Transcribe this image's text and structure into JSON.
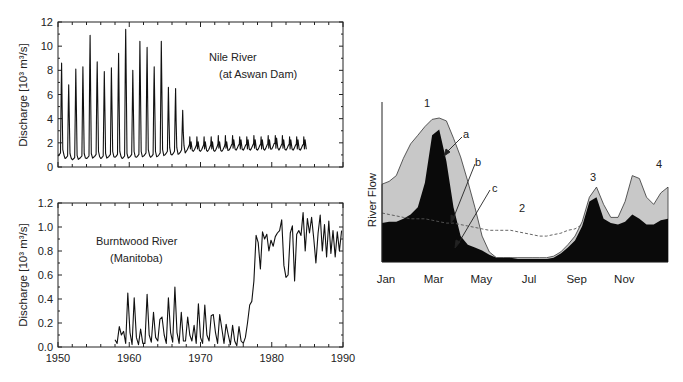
{
  "chart_data": [
    {
      "id": "nile",
      "type": "line",
      "title": "Nile River (at Aswan Dam)",
      "annotation_lines": [
        "Nile River",
        "(at Aswan Dam)"
      ],
      "xlabel": "",
      "ylabel": "Discharge [10³ m³/s]",
      "xlim": [
        1950,
        1990
      ],
      "ylim": [
        0,
        12
      ],
      "yticks": [
        0,
        2,
        4,
        6,
        8,
        10,
        12
      ],
      "xticks": [
        1950,
        1960,
        1970,
        1980,
        1990
      ],
      "show_xtick_labels": false,
      "grid": false,
      "series": [
        {
          "name": "Nile discharge",
          "annual_peaks": {
            "years": [
              1950.5,
              1951.5,
              1952.5,
              1953.5,
              1954.5,
              1955.5,
              1956.5,
              1957.5,
              1958.5,
              1959.5,
              1960.5,
              1961.5,
              1962.5,
              1963.5,
              1964.5,
              1965.5,
              1966.5,
              1967.5,
              1968.5,
              1969.5,
              1970.5,
              1971.5,
              1972.5,
              1973.5,
              1974.5,
              1975.5,
              1976.5,
              1977.5,
              1978.5,
              1979.5,
              1980.5,
              1981.5,
              1982.5,
              1983.5,
              1984.5
            ],
            "values": [
              8.6,
              6.8,
              8.1,
              8.3,
              10.9,
              8.7,
              7.9,
              8.2,
              9.4,
              11.4,
              8.0,
              10.4,
              9.9,
              8.3,
              10.4,
              6.6,
              6.5,
              4.7,
              2.5,
              2.5,
              2.5,
              2.5,
              2.6,
              2.6,
              2.6,
              2.5,
              2.5,
              2.6,
              2.5,
              2.6,
              2.6,
              2.6,
              2.5,
              2.5,
              2.5
            ]
          },
          "annual_lows": [
            0.9,
            0.7,
            0.6,
            0.7,
            0.7,
            0.8,
            0.7,
            0.8,
            0.8,
            0.7,
            0.8,
            0.8,
            0.9,
            0.8,
            0.9,
            1.0,
            1.0,
            1.1,
            1.3,
            1.3,
            1.3,
            1.3,
            1.3,
            1.3,
            1.4,
            1.4,
            1.4,
            1.4,
            1.4,
            1.4,
            1.5,
            1.4,
            1.4,
            1.4,
            1.4
          ]
        }
      ]
    },
    {
      "id": "burntwood",
      "type": "line",
      "title": "Burntwood River (Manitoba)",
      "annotation_lines": [
        "Burntwood River",
        "(Manitoba)"
      ],
      "xlabel": "",
      "ylabel": "Discharge [10³ m³/s]",
      "xlim": [
        1950,
        1990
      ],
      "ylim": [
        0.0,
        1.2
      ],
      "yticks": [
        0.0,
        0.2,
        0.4,
        0.6,
        0.8,
        1.0,
        1.2
      ],
      "ytick_labels": [
        "0.0",
        "0.2",
        "0.4",
        "0.6",
        "0.8",
        "1.0",
        "1.2"
      ],
      "xticks": [
        1950,
        1960,
        1970,
        1980,
        1990
      ],
      "xtick_labels": [
        "1950",
        "1960",
        "1970",
        "1980",
        "1990"
      ],
      "grid": false,
      "series": [
        {
          "name": "Burntwood discharge",
          "x": [
            1958.0,
            1958.3,
            1958.6,
            1958.9,
            1959.2,
            1959.5,
            1959.8,
            1960.1,
            1960.4,
            1960.7,
            1961.0,
            1961.3,
            1961.6,
            1961.9,
            1962.2,
            1962.5,
            1962.8,
            1963.1,
            1963.4,
            1963.7,
            1964.0,
            1964.3,
            1964.6,
            1964.9,
            1965.2,
            1965.5,
            1965.8,
            1966.1,
            1966.4,
            1966.7,
            1967.0,
            1967.3,
            1967.6,
            1967.9,
            1968.2,
            1968.5,
            1968.8,
            1969.1,
            1969.4,
            1969.7,
            1970.0,
            1970.3,
            1970.6,
            1970.9,
            1971.2,
            1971.5,
            1971.8,
            1972.1,
            1972.4,
            1972.7,
            1973.0,
            1973.3,
            1973.6,
            1973.9,
            1974.2,
            1974.5,
            1974.8,
            1975.1,
            1975.4,
            1975.7,
            1976.0,
            1976.3,
            1976.6,
            1976.9,
            1977.2,
            1977.5,
            1977.8,
            1978.1,
            1978.4,
            1978.7,
            1979.0,
            1979.3,
            1979.6,
            1979.9,
            1980.2,
            1980.5,
            1980.8,
            1981.1,
            1981.4,
            1981.7,
            1982.0,
            1982.3,
            1982.6,
            1982.9,
            1983.2,
            1983.5,
            1983.8,
            1984.1,
            1984.4,
            1984.7,
            1985.0,
            1985.3,
            1985.6,
            1985.9,
            1986.2,
            1986.5,
            1986.8,
            1987.1,
            1987.4,
            1987.7,
            1988.0,
            1988.3,
            1988.6,
            1988.9,
            1989.2,
            1989.5,
            1989.8
          ],
          "values": [
            0.06,
            0.03,
            0.17,
            0.1,
            0.13,
            0.03,
            0.45,
            0.12,
            0.02,
            0.41,
            0.08,
            0.02,
            0.15,
            0.03,
            0.03,
            0.44,
            0.1,
            0.04,
            0.29,
            0.08,
            0.05,
            0.23,
            0.25,
            0.1,
            0.03,
            0.41,
            0.12,
            0.04,
            0.5,
            0.12,
            0.03,
            0.29,
            0.05,
            0.05,
            0.25,
            0.1,
            0.05,
            0.18,
            0.03,
            0.36,
            0.08,
            0.03,
            0.35,
            0.1,
            0.05,
            0.26,
            0.27,
            0.12,
            0.03,
            0.27,
            0.15,
            0.03,
            0.19,
            0.1,
            0.02,
            0.18,
            0.05,
            0.01,
            0.17,
            0.05,
            0.03,
            0.08,
            0.2,
            0.35,
            0.38,
            0.55,
            0.93,
            0.87,
            0.65,
            0.96,
            0.9,
            0.94,
            0.8,
            0.89,
            0.84,
            0.92,
            0.95,
            0.97,
            1.06,
            0.68,
            0.58,
            0.6,
            0.95,
            1.01,
            0.55,
            0.94,
            0.97,
            0.93,
            1.12,
            0.8,
            1.07,
            0.95,
            1.08,
            0.9,
            0.7,
            0.95,
            1.1,
            0.8,
            1.02,
            0.75,
            1.05,
            0.78,
            0.97,
            0.75,
            0.96,
            0.8,
            0.97
          ]
        }
      ]
    },
    {
      "id": "regime",
      "type": "area",
      "title": "",
      "xlabel": "",
      "ylabel": "River Flow",
      "xtick_labels": [
        "Jan",
        "Mar",
        "May",
        "Jul",
        "Sep",
        "Nov"
      ],
      "x_months": [
        0,
        0.3,
        0.6,
        0.9,
        1.2,
        1.5,
        1.8,
        2.1,
        2.4,
        2.7,
        3.0,
        3.3,
        3.6,
        3.9,
        4.2,
        4.5,
        4.8,
        5.1,
        5.4,
        5.7,
        6.0,
        6.3,
        6.6,
        6.9,
        7.2,
        7.5,
        7.8,
        8.1,
        8.4,
        8.7,
        9.0,
        9.3,
        9.6,
        9.9,
        10.2,
        10.5,
        10.8,
        11.1,
        11.4,
        11.7,
        12.0
      ],
      "grid": false,
      "annotations": [
        {
          "label": "1",
          "meaning": "spring peak"
        },
        {
          "label": "2",
          "meaning": "summer low"
        },
        {
          "label": "3",
          "meaning": "autumn peak"
        },
        {
          "label": "4",
          "meaning": "winter flow"
        },
        {
          "label": "a",
          "meaning": "arrow to natural flow envelope"
        },
        {
          "label": "b",
          "meaning": "arrow to dashed regulated flow"
        },
        {
          "label": "c",
          "meaning": "arrow to dark baseflow"
        }
      ],
      "series": [
        {
          "name": "a (total flow, light gray)",
          "color": "#c8c8c8",
          "values": [
            0.54,
            0.56,
            0.6,
            0.72,
            0.82,
            0.88,
            0.94,
            0.99,
            1.0,
            0.98,
            0.86,
            0.73,
            0.56,
            0.38,
            0.18,
            0.07,
            0.03,
            0.03,
            0.03,
            0.03,
            0.03,
            0.03,
            0.03,
            0.03,
            0.04,
            0.07,
            0.12,
            0.18,
            0.28,
            0.45,
            0.52,
            0.4,
            0.31,
            0.31,
            0.42,
            0.6,
            0.58,
            0.45,
            0.4,
            0.48,
            0.52
          ]
        },
        {
          "name": "c (baseflow, black)",
          "color": "#0a0a0a",
          "values": [
            0.27,
            0.28,
            0.28,
            0.3,
            0.33,
            0.38,
            0.55,
            0.88,
            0.92,
            0.7,
            0.38,
            0.18,
            0.12,
            0.1,
            0.08,
            0.05,
            0.03,
            0.03,
            0.03,
            0.02,
            0.02,
            0.02,
            0.02,
            0.02,
            0.03,
            0.06,
            0.1,
            0.15,
            0.25,
            0.42,
            0.45,
            0.3,
            0.27,
            0.26,
            0.28,
            0.33,
            0.3,
            0.26,
            0.26,
            0.29,
            0.3
          ]
        },
        {
          "name": "b (regulated, dashed)",
          "color": "#555555",
          "dashed": true,
          "values": [
            0.34,
            0.33,
            0.32,
            0.31,
            0.3,
            0.3,
            0.3,
            0.29,
            0.28,
            0.27,
            0.27,
            0.26,
            0.25,
            0.24,
            0.23,
            0.22,
            0.22,
            0.22,
            0.22,
            0.21,
            0.2,
            0.19,
            0.18,
            0.18,
            0.19,
            0.2,
            0.22,
            0.23,
            0.26,
            0.27,
            0.27,
            0.27,
            0.27,
            0.27,
            0.27,
            0.27,
            0.27,
            0.27,
            0.27,
            0.27,
            0.27
          ]
        }
      ]
    }
  ]
}
